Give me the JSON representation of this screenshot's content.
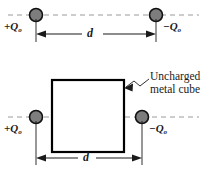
{
  "figure": {
    "width": 207,
    "height": 175,
    "background": "#ffffff",
    "line_color": "#1a1a1a",
    "dashed_axis_color": "#9a9a9a",
    "charge_fill": "#7d7d7d",
    "charge_stroke": "#111111",
    "cube_fill": "#ffffff",
    "cube_stroke": "#000000"
  },
  "panels": [
    {
      "id": "top-panel",
      "name": "two-point-charges",
      "left_charge": {
        "sign": "+",
        "symbol": "Q",
        "subscript": "o",
        "label": "+Q",
        "full_label": "+Qo"
      },
      "right_charge": {
        "sign": "−",
        "symbol": "Q",
        "subscript": "o",
        "label": "−Q",
        "full_label": "−Qo"
      },
      "dimension": {
        "label": "d",
        "description": "separation between charges"
      },
      "axis": {
        "style": "dashed",
        "description": "horizontal dashed center axis through both charges"
      }
    },
    {
      "id": "bottom-panel",
      "name": "charges-with-metal-cube",
      "left_charge": {
        "sign": "+",
        "symbol": "Q",
        "subscript": "o",
        "label": "+Q",
        "full_label": "+Qo"
      },
      "right_charge": {
        "sign": "−",
        "symbol": "Q",
        "subscript": "o",
        "label": "−Q",
        "full_label": "−Qo"
      },
      "dimension": {
        "label": "d",
        "description": "separation between charges"
      },
      "axis": {
        "style": "dashed",
        "description": "horizontal dashed center axis through both charges"
      },
      "callout": {
        "line1": "Uncharged",
        "line2": "metal cube",
        "target": "square metal cube drawn between the two charges"
      },
      "cube": {
        "shape": "square",
        "fill": "white",
        "stroke": "black"
      }
    }
  ]
}
